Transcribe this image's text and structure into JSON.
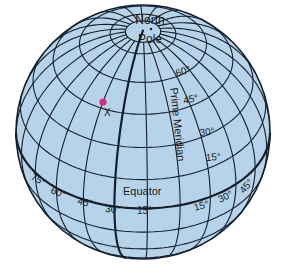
{
  "diagram": {
    "colors": {
      "ocean": "#b7d3ea",
      "grid": "#15202c",
      "outline": "#15202c",
      "marker": "#d12f7c",
      "background": "#ffffff"
    },
    "projection": {
      "cx": 143,
      "cy": 132,
      "r": 127,
      "tilt_deg": 37,
      "center_lon_deg": 13
    },
    "grid_step_deg": 15,
    "labels": {
      "north_pole_line1": "North",
      "north_pole_line2": "Pole",
      "prime_meridian": "Prime Meridian",
      "equator": "Equator",
      "point": "X"
    },
    "latitude_labels": [
      "60°",
      "45°",
      "30°",
      "15°"
    ],
    "west_longitude_labels": [
      "75°",
      "60°",
      "45°",
      "30°",
      "15°"
    ],
    "east_longitude_labels": [
      "15°",
      "30°",
      "45°"
    ],
    "point_x": {
      "lat": 45,
      "lon": -45
    }
  }
}
